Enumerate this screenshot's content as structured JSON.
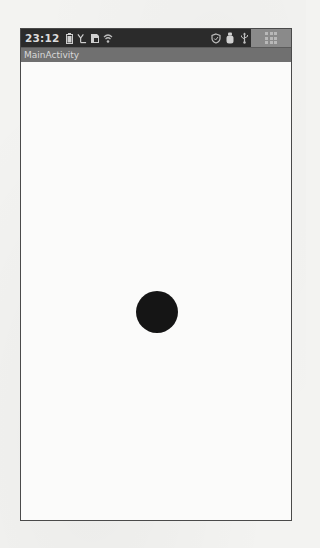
{
  "status_bar": {
    "time": "23:12",
    "left_icons": [
      "battery-icon",
      "signal-icon",
      "sd-card-icon",
      "wifi-icon"
    ],
    "right_icons": [
      "shield-icon",
      "debug-icon",
      "usb-icon"
    ],
    "launcher_icon": "app-grid-icon"
  },
  "app": {
    "title": "MainActivity"
  },
  "canvas": {
    "circle": {
      "color": "#151515",
      "center_x": 156,
      "center_y": 311,
      "radius": 21
    }
  },
  "colors": {
    "status_bar_bg": "#2b2b2b",
    "title_bar_bg": "#707070",
    "content_bg": "#fbfbfa"
  }
}
